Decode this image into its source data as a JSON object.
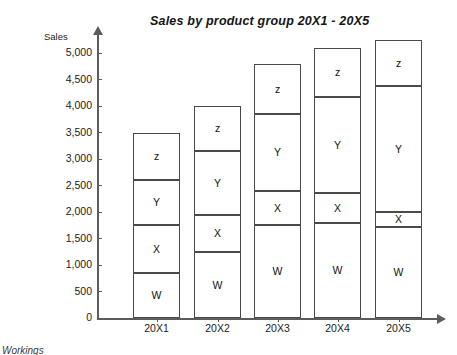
{
  "chart_data": {
    "type": "bar",
    "title": "Sales by product group 20X1 - 20X5",
    "subtitle": "",
    "stacked": true,
    "xlabel": "",
    "ylabel": "Sales",
    "y_unit": "£",
    "ylim": [
      0,
      5500
    ],
    "grid": false,
    "legend_position": "none",
    "y_ticks": [
      0,
      500,
      1000,
      1500,
      2000,
      2500,
      3000,
      3500,
      4000,
      4500,
      5000
    ],
    "y_tick_labels": [
      "0",
      "500",
      "1,000",
      "1,500",
      "2,000",
      "2,500",
      "3,000",
      "3,500",
      "4,000",
      "4,500",
      "5,000"
    ],
    "categories": [
      "20X1",
      "20X2",
      "20X3",
      "20X4",
      "20X5"
    ],
    "series": [
      {
        "name": "W",
        "values": [
          850,
          1250,
          1750,
          1800,
          1725
        ]
      },
      {
        "name": "X",
        "values": [
          900,
          700,
          650,
          550,
          275
        ]
      },
      {
        "name": "Y",
        "values": [
          850,
          1200,
          1450,
          1825,
          2375
        ]
      },
      {
        "name": "Z",
        "values": [
          900,
          850,
          950,
          925,
          875
        ]
      }
    ],
    "totals": [
      3500,
      4000,
      4800,
      5100,
      5250
    ],
    "segment_tops": [
      [
        850,
        1750,
        2600,
        3500
      ],
      [
        1250,
        1950,
        3150,
        4000
      ],
      [
        1750,
        2400,
        3850,
        4800
      ],
      [
        1800,
        2350,
        4175,
        5100
      ],
      [
        1725,
        2000,
        4375,
        5250
      ]
    ],
    "segment_labels": [
      "W",
      "X",
      "Y",
      "z"
    ]
  },
  "axis": {
    "sales_label": "Sales",
    "currency_symbol": "£"
  },
  "footer": {
    "note": "Workings"
  }
}
